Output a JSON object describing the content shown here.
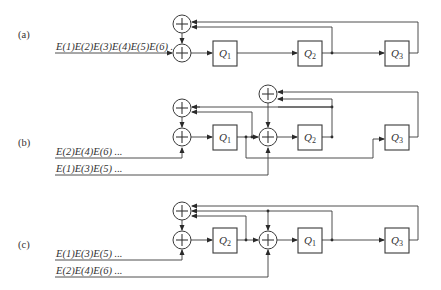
{
  "figure": {
    "panels": [
      {
        "label": "(a)",
        "inputs": [
          "E(1)E(2)E(3)E(4)E(5)E(6) ..."
        ],
        "registers": [
          {
            "name": "Q",
            "sub": "1"
          },
          {
            "name": "Q",
            "sub": "2"
          },
          {
            "name": "Q",
            "sub": "3"
          }
        ]
      },
      {
        "label": "(b)",
        "inputs": [
          "E(2)E(4)E(6) ...",
          "E(1)E(3)E(5) ..."
        ],
        "registers": [
          {
            "name": "Q",
            "sub": "1"
          },
          {
            "name": "Q",
            "sub": "2"
          },
          {
            "name": "Q",
            "sub": "3"
          }
        ]
      },
      {
        "label": "(c)",
        "inputs": [
          "E(1)E(3)E(5) ...",
          "E(2)E(4)E(6) ..."
        ],
        "registers": [
          {
            "name": "Q",
            "sub": "2"
          },
          {
            "name": "Q",
            "sub": "1"
          },
          {
            "name": "Q",
            "sub": "3"
          }
        ]
      }
    ],
    "adder_symbol": "+"
  }
}
